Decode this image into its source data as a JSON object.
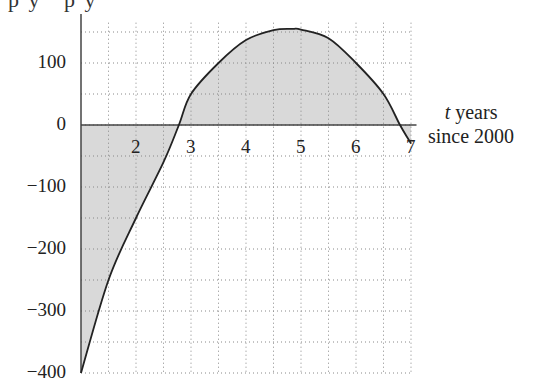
{
  "cropped_top_text": "p y   p y",
  "chart_data": {
    "type": "area",
    "title": "",
    "xlabel_var": "t",
    "xlabel_line1": "years",
    "xlabel_line2": "since 2000",
    "ylabel": "",
    "x_ticks": [
      "2",
      "3",
      "4",
      "5",
      "6",
      "7"
    ],
    "y_ticks": [
      "100",
      "0",
      "−100",
      "−200",
      "−300",
      "−400"
    ],
    "xlim": [
      1,
      7
    ],
    "ylim": [
      -400,
      175
    ],
    "grid": true,
    "grid_style": "dotted",
    "grid_x_step": 0.5,
    "grid_y_step": 50,
    "shaded_between_curve_and_axis": true,
    "series": [
      {
        "name": "f(t)",
        "x": [
          1,
          1.5,
          2,
          2.5,
          2.78,
          3,
          3.5,
          4,
          4.5,
          4.85,
          5,
          5.5,
          6,
          6.5,
          6.8,
          7
        ],
        "y": [
          -400,
          -250,
          -150,
          -60,
          0,
          50,
          100,
          137,
          153,
          155,
          154,
          140,
          100,
          50,
          0,
          -30
        ]
      }
    ],
    "colors": {
      "curve": "#222222",
      "fill": "#d9d9d9",
      "grid": "#888888",
      "axis": "#444444"
    }
  }
}
